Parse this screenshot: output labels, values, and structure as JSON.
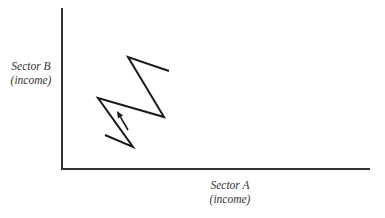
{
  "diagram": {
    "y_axis": {
      "label_line1": "Sector B",
      "label_line2": "(income)"
    },
    "x_axis": {
      "label_line1": "Sector A",
      "label_line2": "(income)"
    },
    "path_points": [
      [
        105,
        135
      ],
      [
        133,
        147
      ],
      [
        98,
        98
      ],
      [
        164,
        117
      ],
      [
        128,
        57
      ],
      [
        169,
        71
      ]
    ],
    "arrow": {
      "from": [
        128,
        130
      ],
      "to": [
        117,
        111
      ]
    },
    "colors": {
      "line": "#1a1a1a",
      "axis": "#333333",
      "text": "#333333"
    }
  }
}
